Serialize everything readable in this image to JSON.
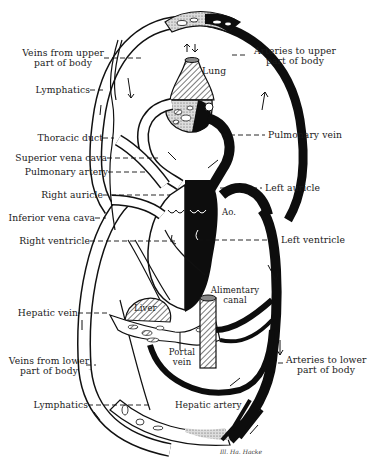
{
  "diagram": {
    "colors": {
      "arterial": "#0d0d0d",
      "venous": "#ffffff",
      "outline": "#111111",
      "hatch": "#333333",
      "background": "#ffffff"
    },
    "labels_left": [
      {
        "id": "veins-upper",
        "line1": "Veins from upper",
        "line2": "part of body"
      },
      {
        "id": "lymphatics-upper",
        "line1": "Lymphatics"
      },
      {
        "id": "thoracic-duct",
        "line1": "Thoracic duct"
      },
      {
        "id": "superior-vena-cava",
        "line1": "Superior vena cava"
      },
      {
        "id": "pulmonary-artery",
        "line1": "Pulmonary artery"
      },
      {
        "id": "right-auricle",
        "line1": "Right auricle"
      },
      {
        "id": "inferior-vena-cava",
        "line1": "Inferior vena cava"
      },
      {
        "id": "right-ventricle",
        "line1": "Right ventricle"
      },
      {
        "id": "hepatic-vein",
        "line1": "Hepatic vein"
      },
      {
        "id": "veins-lower",
        "line1": "Veins from lower",
        "line2": "part of body"
      },
      {
        "id": "lymphatics-lower",
        "line1": "Lymphatics"
      }
    ],
    "labels_right": [
      {
        "id": "arteries-upper",
        "line1": "Arteries to upper",
        "line2": "part of body"
      },
      {
        "id": "pulmonary-vein",
        "line1": "Pulmonary vein"
      },
      {
        "id": "left-auricle",
        "line1": "Left auricle"
      },
      {
        "id": "left-ventricle",
        "line1": "Left ventricle"
      },
      {
        "id": "arteries-lower",
        "line1": "Arteries to lower",
        "line2": "part of body"
      }
    ],
    "labels_inner": {
      "lung": "Lung",
      "aorta": "Ao.",
      "liver": "Liver",
      "alimentary_line1": "Alimentary",
      "alimentary_line2": "canal",
      "portal_line1": "Portal",
      "portal_line2": "vein",
      "hepatic_artery": "Hepatic artery"
    },
    "signature": "Ill. Ha. Hacke"
  }
}
